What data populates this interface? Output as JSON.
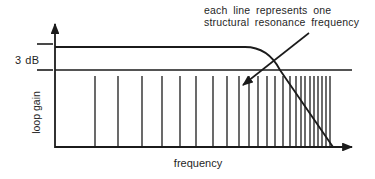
{
  "annotation": {
    "line1": "each line represents one",
    "line2": "structural resonance frequency"
  },
  "axis_labels": {
    "y": "loop gain",
    "x": "frequency"
  },
  "gain_reference": {
    "label": "3 dB"
  },
  "colors": {
    "ink": "#1b1b1b",
    "background": "#ffffff"
  },
  "diagram": {
    "y_axis": {
      "x": 55,
      "top": 24,
      "bottom": 148
    },
    "x_axis": {
      "y": 147,
      "left": 55,
      "right": 352
    },
    "db_down_line": {
      "y": 70,
      "left": 55,
      "right": 352
    },
    "tick_upper": {
      "y": 44,
      "x1": 37,
      "x2": 53
    },
    "tick_lower": {
      "y": 70,
      "x1": 37,
      "x2": 53
    },
    "loop_gain_curve_path": "M 55 47 H 245 Q 268 47 280 70 L 333 147",
    "pointer_arrow": {
      "x1": 309,
      "y1": 33,
      "x2": 243,
      "y2": 85
    },
    "resonance_lines": {
      "top": 76,
      "bottom": 147,
      "x_positions": [
        95,
        118,
        142,
        162,
        180,
        196,
        213,
        227,
        239,
        249,
        258,
        267,
        275,
        283,
        290,
        296,
        301,
        305,
        310,
        314,
        318,
        322,
        326,
        330
      ]
    }
  }
}
